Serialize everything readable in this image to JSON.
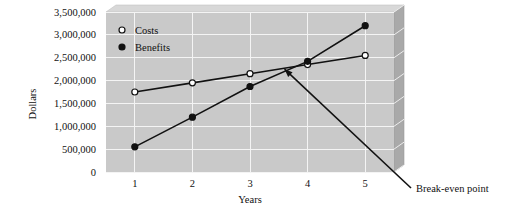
{
  "chart_data": {
    "type": "line",
    "title": "",
    "xlabel": "Years",
    "ylabel": "Dollars",
    "x": [
      1,
      2,
      3,
      4,
      5
    ],
    "xtick_labels": [
      "1",
      "2",
      "3",
      "4",
      "5"
    ],
    "xlim": [
      0.5,
      5.5
    ],
    "ylim": [
      0,
      3500000
    ],
    "ytick_values": [
      0,
      500000,
      1000000,
      1500000,
      2000000,
      2500000,
      3000000,
      3500000
    ],
    "ytick_labels": [
      "0",
      "500,000",
      "1,000,000",
      "1,500,000",
      "2,000,000",
      "2,500,000",
      "3,000,000",
      "3,500,000"
    ],
    "grid": true,
    "legend_position": "top-left",
    "series": [
      {
        "name": "Costs",
        "marker": "open-circle",
        "values": [
          1750000,
          1950000,
          2150000,
          2350000,
          2550000
        ]
      },
      {
        "name": "Benefits",
        "marker": "filled-circle",
        "values": [
          550000,
          1200000,
          1870000,
          2420000,
          3200000
        ]
      }
    ],
    "annotations": [
      {
        "text": "Break-even point",
        "target_x": 3.6,
        "target_y": 2250000
      }
    ],
    "colors": {
      "plot_background": "#c9c9c9",
      "panel_side": "#a8a8a8",
      "gridline": "#f2f2f2",
      "line": "#111111",
      "page_background": "#ffffff"
    }
  }
}
